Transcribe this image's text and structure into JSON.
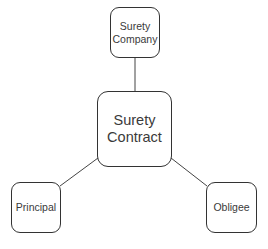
{
  "diagram": {
    "type": "hub-and-spoke",
    "center": {
      "id": "surety-contract",
      "label": "Surety\nContract"
    },
    "nodes": [
      {
        "id": "surety-company",
        "label": "Surety\nCompany",
        "position": "top"
      },
      {
        "id": "principal",
        "label": "Principal",
        "position": "bottom-left"
      },
      {
        "id": "obligee",
        "label": "Obligee",
        "position": "bottom-right"
      }
    ],
    "edges": [
      {
        "from": "surety-contract",
        "to": "surety-company"
      },
      {
        "from": "surety-contract",
        "to": "principal"
      },
      {
        "from": "surety-contract",
        "to": "obligee"
      }
    ],
    "colors": {
      "stroke": "#333333",
      "text": "#3a3a3a",
      "background": "#ffffff"
    }
  }
}
